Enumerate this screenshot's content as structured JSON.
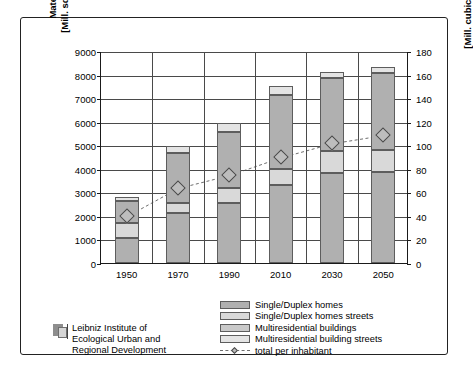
{
  "chart_data": {
    "type": "bar",
    "title": "",
    "subtitle": "",
    "categories": [
      "1950",
      "1970",
      "1990",
      "2010",
      "2030",
      "2050"
    ],
    "xlabel": "",
    "ylabel": "Materials\n[Mill. square m]",
    "ylabel_secondary": "[Mill. cubic m/inhabitant]",
    "ylim": [
      0,
      9000
    ],
    "yticks": [
      0,
      1000,
      2000,
      3000,
      4000,
      5000,
      6000,
      7000,
      8000,
      9000
    ],
    "ylim_secondary": [
      0,
      180
    ],
    "yticks_secondary": [
      0,
      20,
      40,
      60,
      80,
      100,
      120,
      140,
      160,
      180
    ],
    "grid": true,
    "legend_position": "bottom-center",
    "stacked": true,
    "series": [
      {
        "name": "Single/Duplex homes",
        "axis": "left",
        "color": "#b0b0b0",
        "values": [
          1080,
          2130,
          2550,
          3330,
          3820,
          3850
        ]
      },
      {
        "name": "Single/Duplex homes streets",
        "axis": "left",
        "color": "#d9d9d9",
        "values": [
          600,
          420,
          650,
          680,
          920,
          930
        ]
      },
      {
        "name": "Multiresidential buildings",
        "axis": "left",
        "color": "#b0b0b0",
        "values": [
          950,
          2100,
          2350,
          3120,
          3100,
          3300
        ]
      },
      {
        "name": "Multiresidential building streets",
        "axis": "left",
        "color": "#e4e4e4",
        "values": [
          180,
          300,
          400,
          370,
          280,
          250
        ]
      },
      {
        "name": "total per inhabitant",
        "axis": "right",
        "type": "line",
        "style": "dashed",
        "marker": "diamond",
        "color": "#6e6e6e",
        "values": [
          40,
          64,
          75,
          90,
          102,
          109
        ]
      }
    ]
  },
  "axes": {
    "left_title_line1": "Materials",
    "left_title_line2": "[Mill. square m]",
    "right_title": "[Mill. cubic m/inhabitant]"
  },
  "legend": {
    "items": [
      {
        "label": "Single/Duplex homes",
        "swatch": "#b0b0b0",
        "kind": "swatch"
      },
      {
        "label": "Single/Duplex homes streets",
        "swatch": "#d9d9d9",
        "kind": "swatch"
      },
      {
        "label": "Multiresidential buildings",
        "swatch": "#c9c9c9",
        "kind": "swatch"
      },
      {
        "label": "Multiresidential building streets",
        "swatch": "#e4e4e4",
        "kind": "swatch"
      },
      {
        "label": "total per inhabitant",
        "swatch": "#6e6e6e",
        "kind": "line"
      }
    ]
  },
  "attribution": {
    "line1": "Leibniz Institute of",
    "line2": "Ecological Urban and",
    "line3": "Regional Development"
  }
}
